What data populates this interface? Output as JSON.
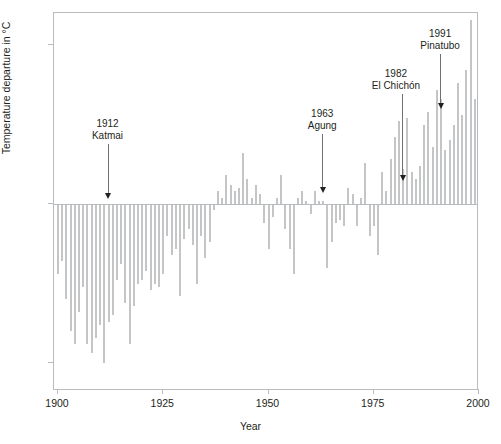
{
  "chart_data": {
    "type": "bar",
    "title": "",
    "xlabel": "Year",
    "ylabel": "Temperature departure in °C",
    "xlim": [
      1899,
      2000
    ],
    "ylim": [
      -0.6,
      0.69
    ],
    "grid": false,
    "legend": null,
    "xticks": [
      {
        "value": 1900,
        "label": "1900"
      },
      {
        "value": 1925,
        "label": "1925"
      },
      {
        "value": 1950,
        "label": "1950"
      },
      {
        "value": 1975,
        "label": "1975"
      },
      {
        "value": 2000,
        "label": "2000"
      }
    ],
    "yticks": [
      {
        "value": 0.5,
        "label": "+0.5"
      },
      {
        "value": 0.0,
        "label": "0"
      },
      {
        "value": -0.5,
        "label": "-0.5"
      }
    ],
    "bar_color": "#c3c5c7",
    "x": [
      1900,
      1901,
      1902,
      1903,
      1904,
      1905,
      1906,
      1907,
      1908,
      1909,
      1910,
      1911,
      1912,
      1913,
      1914,
      1915,
      1916,
      1917,
      1918,
      1919,
      1920,
      1921,
      1922,
      1923,
      1924,
      1925,
      1926,
      1927,
      1928,
      1929,
      1930,
      1931,
      1932,
      1933,
      1934,
      1935,
      1936,
      1937,
      1938,
      1939,
      1940,
      1941,
      1942,
      1943,
      1944,
      1945,
      1946,
      1947,
      1948,
      1949,
      1950,
      1951,
      1952,
      1953,
      1954,
      1955,
      1956,
      1957,
      1958,
      1959,
      1960,
      1961,
      1962,
      1963,
      1964,
      1965,
      1966,
      1967,
      1968,
      1969,
      1970,
      1971,
      1972,
      1973,
      1974,
      1975,
      1976,
      1977,
      1978,
      1979,
      1980,
      1981,
      1982,
      1983,
      1984,
      1985,
      1986,
      1987,
      1988,
      1989,
      1990,
      1991,
      1992,
      1993,
      1994,
      1995,
      1996,
      1997,
      1998,
      1999
    ],
    "values": [
      -0.22,
      -0.18,
      -0.3,
      -0.4,
      -0.44,
      -0.34,
      -0.26,
      -0.44,
      -0.47,
      -0.42,
      -0.38,
      -0.5,
      -0.37,
      -0.35,
      -0.24,
      -0.19,
      -0.31,
      -0.44,
      -0.32,
      -0.25,
      -0.24,
      -0.21,
      -0.27,
      -0.25,
      -0.26,
      -0.22,
      -0.1,
      -0.16,
      -0.14,
      -0.29,
      -0.11,
      -0.08,
      -0.13,
      -0.25,
      -0.1,
      -0.17,
      -0.12,
      -0.02,
      0.04,
      0.02,
      0.09,
      0.06,
      0.04,
      0.05,
      0.16,
      0.08,
      0.02,
      0.06,
      0.03,
      -0.06,
      -0.14,
      -0.04,
      0.02,
      0.09,
      -0.08,
      -0.14,
      -0.22,
      0.02,
      0.04,
      0.01,
      -0.03,
      0.04,
      0.01,
      0.01,
      -0.2,
      -0.12,
      -0.06,
      -0.05,
      -0.07,
      0.05,
      0.03,
      -0.07,
      0.02,
      0.13,
      -0.1,
      -0.07,
      -0.16,
      0.1,
      0.04,
      0.14,
      0.21,
      0.26,
      0.11,
      0.27,
      0.1,
      0.08,
      0.12,
      0.25,
      0.29,
      0.18,
      0.36,
      0.33,
      0.17,
      0.2,
      0.25,
      0.38,
      0.28,
      0.42,
      0.58,
      0.33
    ],
    "annotations": [
      {
        "id": "katmai",
        "year_label": "1912",
        "name": "Katmai",
        "x": 1912,
        "text_x": 1912,
        "text_top_y": 118,
        "arrow_tip_y": 199
      },
      {
        "id": "agung",
        "year_label": "1963",
        "name": "Agung",
        "x": 1963,
        "text_x": 1963,
        "text_top_y": 108,
        "arrow_tip_y": 193
      },
      {
        "id": "elchichon",
        "year_label": "1982",
        "name": "El Chichón",
        "x": 1982,
        "text_x": 1980.5,
        "text_top_y": 68,
        "arrow_tip_y": 181
      },
      {
        "id": "pinatubo",
        "year_label": "1991",
        "name": "Pinatubo",
        "x": 1991,
        "text_x": 1991,
        "text_top_y": 28,
        "arrow_tip_y": 109
      }
    ]
  }
}
